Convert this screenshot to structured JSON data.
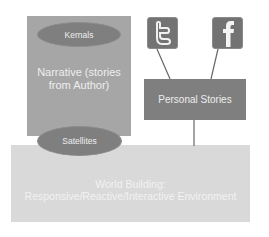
{
  "diagram": {
    "narrative": {
      "label_line1": "Narrative (stories",
      "label_line2": "from Author)"
    },
    "kernals": {
      "label": "Kernals"
    },
    "satellites": {
      "label": "Satellites"
    },
    "personal_stories": {
      "label": "Personal Stories"
    },
    "social_icons": [
      {
        "name": "twitter-icon",
        "glyph": "t"
      },
      {
        "name": "facebook-icon",
        "glyph": "f"
      }
    ],
    "world_building": {
      "label_line1": "World Building:",
      "label_line2": "Responsive/Reactive/Interactive Environment"
    },
    "colors": {
      "world_fill": "#d9d9d9",
      "narrative_fill": "#a6a6a6",
      "ellipse_fill": "#7f7f7f",
      "personal_fill": "#7f7f7f",
      "icon_fill": "#737373",
      "text": "#eeeeee"
    },
    "connections": [
      {
        "from": "twitter-icon",
        "to": "personal-stories"
      },
      {
        "from": "facebook-icon",
        "to": "personal-stories"
      },
      {
        "from": "personal-stories",
        "to": "world-building"
      }
    ]
  }
}
